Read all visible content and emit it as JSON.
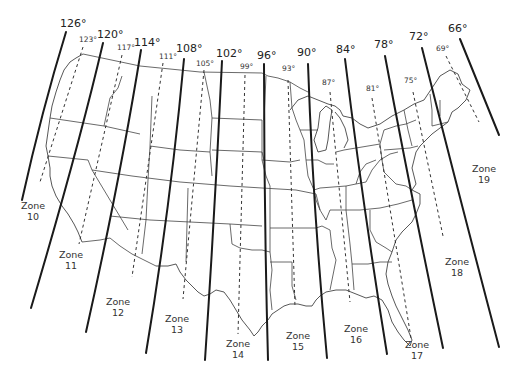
{
  "zone_boundaries": [
    {
      "label": "126°",
      "x": 60,
      "y": 27,
      "path": "M66,32 Q42,110 22,200"
    },
    {
      "label": "120°",
      "x": 97,
      "y": 38,
      "path": "M103,43 Q78,150 31,308"
    },
    {
      "label": "114°",
      "x": 134,
      "y": 46,
      "path": "M141,50 Q120,180 86,332"
    },
    {
      "label": "108°",
      "x": 176,
      "y": 52,
      "path": "M184,59 Q170,210 146,353"
    },
    {
      "label": "102°",
      "x": 216,
      "y": 57,
      "path": "M222,61 Q215,210 205,360"
    },
    {
      "label": "96°",
      "x": 257,
      "y": 59,
      "path": "M264,64 Q264,210 268,360"
    },
    {
      "label": "90°",
      "x": 297,
      "y": 56,
      "path": "M308,64 Q313,210 327,358"
    },
    {
      "label": "84°",
      "x": 336,
      "y": 53,
      "path": "M345,59 Q362,200 387,354"
    },
    {
      "label": "78°",
      "x": 374,
      "y": 48,
      "path": "M385,56 Q410,190 443,348"
    },
    {
      "label": "72°",
      "x": 409,
      "y": 40,
      "path": "M422,48 Q455,180 499,347"
    },
    {
      "label": "66°",
      "x": 448,
      "y": 32,
      "path": "M460,39 Q485,100 499,135"
    }
  ],
  "central_meridians": [
    {
      "label": "123°",
      "x": 79,
      "y": 42,
      "path": "M83,47 L40,182"
    },
    {
      "label": "117°",
      "x": 117,
      "y": 50,
      "path": "M122,55 L79,244"
    },
    {
      "label": "111°",
      "x": 159,
      "y": 59,
      "path": "M163,63 L132,277"
    },
    {
      "label": "105°",
      "x": 196,
      "y": 66,
      "path": "M204,70 L183,299"
    },
    {
      "label": "99°",
      "x": 240,
      "y": 69,
      "path": "M245,75 L238,334"
    },
    {
      "label": "93°",
      "x": 282,
      "y": 71,
      "path": "M288,80 L295,307"
    },
    {
      "label": "87°",
      "x": 322,
      "y": 85,
      "path": "M330,92 L350,302"
    },
    {
      "label": "81°",
      "x": 366,
      "y": 91,
      "path": "M372,98 L411,338"
    },
    {
      "label": "75°",
      "x": 404,
      "y": 83,
      "path": "M413,92 L443,236"
    },
    {
      "label": "69°",
      "x": 436,
      "y": 51,
      "path": "M446,56 L479,122"
    }
  ],
  "zones": [
    {
      "label": "Zone",
      "num": "10",
      "x": 33,
      "y": 209
    },
    {
      "label": "Zone",
      "num": "11",
      "x": 71,
      "y": 258
    },
    {
      "label": "Zone",
      "num": "12",
      "x": 118,
      "y": 305
    },
    {
      "label": "Zone",
      "num": "13",
      "x": 177,
      "y": 322
    },
    {
      "label": "Zone",
      "num": "14",
      "x": 238,
      "y": 347
    },
    {
      "label": "Zone",
      "num": "15",
      "x": 298,
      "y": 339
    },
    {
      "label": "Zone",
      "num": "16",
      "x": 356,
      "y": 332
    },
    {
      "label": "Zone",
      "num": "17",
      "x": 417,
      "y": 348
    },
    {
      "label": "Zone",
      "num": "18",
      "x": 457,
      "y": 265
    },
    {
      "label": "Zone",
      "num": "19",
      "x": 484,
      "y": 172
    }
  ],
  "colors": {
    "lines": "#1a1a1a",
    "background": "#ffffff",
    "borders": "#444444"
  }
}
